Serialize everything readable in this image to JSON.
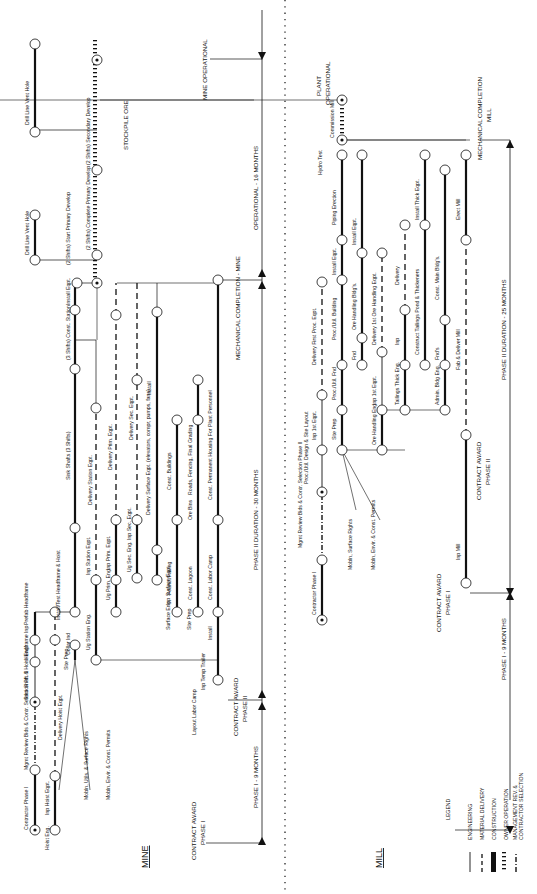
{
  "figure": {
    "orientation": "rotated-90-ccw",
    "sections": {
      "mine": "MINE",
      "mill": "MILL"
    }
  },
  "legend": {
    "title": "LEGEND",
    "items": [
      {
        "style": "thin-solid",
        "label": "ENGINEERING"
      },
      {
        "style": "dashed",
        "label": "MATERIAL DELIVERY"
      },
      {
        "style": "thick-solid",
        "label": "CONSTRUCTION"
      },
      {
        "style": "hatched",
        "label": "OWNER OPERATION"
      },
      {
        "style": "dash-dot",
        "label": "MANAGEMENT REV. &"
      },
      {
        "style": "dash-dot-cont",
        "label": "CONTRACTOR SELECTION"
      }
    ]
  },
  "mine": {
    "milestones": {
      "contract_award_1": "CONTRACT AWARD",
      "contract_award_1b": "PHASE I",
      "contract_award_2": "CONTRACT AWARD",
      "contract_award_2b": "PHASE II",
      "mech_completion": "MECHANICAL COMPLETION - MINE",
      "operational": "MINE OPERATIONAL",
      "stockpile": "STOCKPILE ORE"
    },
    "durations": {
      "phase1": "PHASE I - 9 MONTHS",
      "phase2": "PHASE II DURATION - 30 MONTHS",
      "operational": "OPERATIONAL - 16 MONTHS"
    },
    "activities": [
      {
        "label": "Contractor Phase I",
        "dur": "4"
      },
      {
        "label": "Mgmt Review Bids & Contr. Selection Ph. II",
        "dur": "5"
      },
      {
        "label": "Stkn Shaft & Hoist Eng.",
        "dur": "3"
      },
      {
        "label": "Headframe Inp",
        "dur": "2"
      },
      {
        "label": "Prefab Headframe",
        "dur": "2"
      },
      {
        "label": "Install/Test Headframe & Hoist",
        "dur": "2"
      },
      {
        "label": "Hoist Eng.",
        "dur": "1"
      },
      {
        "label": "Inp Hoist Eqpt.",
        "dur": "3"
      },
      {
        "label": "Delivery Hoist Eqpt.",
        "dur": "12"
      },
      {
        "label": "Site Prep",
        "dur": "1"
      },
      {
        "label": "Collar Ind",
        "dur": "3"
      },
      {
        "label": "Ug Station Eng.",
        "dur": "4"
      },
      {
        "label": "Inp Station Eqpt.",
        "dur": "4"
      },
      {
        "label": "Delivery Station Eqpt.",
        "dur": "12"
      },
      {
        "label": "Ug Prim. Eng.",
        "dur": "3"
      },
      {
        "label": "Inp Prim. Eqpt.",
        "dur": "4"
      },
      {
        "label": "Delivery Prim. Eqpt.",
        "dur": "12"
      },
      {
        "label": "Ug Sec. Eng.",
        "dur": "3"
      },
      {
        "label": "Inp Sec. Eqpt.",
        "dur": "4"
      },
      {
        "label": "Delivery Sec. Eqpt.",
        "dur": "14"
      },
      {
        "label": "Sink Shafts (3 Shifts)",
        "dur": "15"
      },
      {
        "label": "(3 Shifts) Const. Station",
        "dur": "4"
      },
      {
        "label": "Install Eqpt.",
        "dur": "3"
      },
      {
        "label": "(2 Shifts) Start Primary Develop",
        "dur": "2"
      },
      {
        "label": "(2 Shifts) Complete Primary Develop",
        "dur": "6"
      },
      {
        "label": "(2 Shifts) Secondary Develop",
        "dur": "5"
      },
      {
        "label": "Drill Line Vent Hole",
        "dur": "6"
      },
      {
        "label": "Drill Line Vent Hole",
        "dur": "6"
      },
      {
        "label": "Surface Eng.",
        "dur": "1"
      },
      {
        "label": "Inp Surface Eqpt.",
        "dur": "4"
      },
      {
        "label": "Delivery Surface Eqpt. (elevators, compr, pumps, fans)",
        "dur": "11"
      },
      {
        "label": "Install",
        "dur": "8"
      },
      {
        "label": "Site Prep",
        "dur": "2"
      },
      {
        "label": "Found./Paving",
        "dur": "6"
      },
      {
        "label": "Const. Buildings",
        "dur": "9"
      },
      {
        "label": "Const. Lagoon",
        "dur": "6"
      },
      {
        "label": "Ore Bins",
        "dur": "3"
      },
      {
        "label": "Roads, Fencing, Final Grading",
        "dur": "7"
      },
      {
        "label": "Layout Labor Camp",
        "dur": "1"
      },
      {
        "label": "Inp Temp Trailer",
        "dur": "2"
      },
      {
        "label": "Install",
        "dur": "2"
      },
      {
        "label": "Const. Labor Camp",
        "dur": "6"
      },
      {
        "label": "Const. Permanent Housing For Plant Personnel",
        "dur": "19"
      }
    ],
    "notes": [
      "Mobln, Utils. & Surface Rights",
      "Mobln, Envir. & Const. Permits"
    ],
    "floats": [
      "F2",
      "F3",
      "F5",
      "F5",
      "F8"
    ]
  },
  "mill": {
    "milestones": {
      "contract_award_1": "CONTRACT AWARD",
      "contract_award_1b": "PHASE I",
      "contract_award_2": "CONTRACT AWARD",
      "contract_award_2b": "PHASE II",
      "mech_completion": "MECHANICAL COMPLETION",
      "mech_completion_b": "MILL",
      "operational": "PLANT",
      "operational_b": "OPERATIONAL"
    },
    "durations": {
      "phase1": "PHASE I - 9 MONTHS",
      "phase2": "PHASE II DURATION - 25 MONTHS"
    },
    "activities": [
      {
        "label": "Contractor Phase I",
        "dur": "4"
      },
      {
        "label": "Mgmt Review Bids & Contr. Selection Phase II",
        "dur": "5"
      },
      {
        "label": "Proc./Util. Design & Site Layout",
        "dur": "3"
      },
      {
        "label": "Site Prep",
        "dur": "3"
      },
      {
        "label": "Inp 1st Eqpt.",
        "dur": "4"
      },
      {
        "label": "Proc./Util. Fnd",
        "dur": "3"
      },
      {
        "label": "Delivery First Proc. Eqpt.",
        "dur": "8"
      },
      {
        "label": "Proc./Util. Building",
        "dur": "6"
      },
      {
        "label": "Install Eqpt.",
        "dur": "3"
      },
      {
        "label": "Piping Erection",
        "dur": "6"
      },
      {
        "label": "Hydro Test",
        "dur": "1"
      },
      {
        "label": "Commission Mill",
        "dur": "3"
      },
      {
        "label": "Fnd",
        "dur": "2"
      },
      {
        "label": "Ore Handling Bldg's.",
        "dur": "6"
      },
      {
        "label": "Install Eqpt.",
        "dur": "7"
      },
      {
        "label": "Ore Handling Eng.",
        "dur": "3"
      },
      {
        "label": "Inp 1st Eqpt.",
        "dur": "4"
      },
      {
        "label": "Delivery 1st Ore Handling Eqpt.",
        "dur": "7"
      },
      {
        "label": "Tailings Thick Eng.",
        "dur": "3"
      },
      {
        "label": "Inp",
        "dur": "4"
      },
      {
        "label": "Delivery",
        "dur": "6"
      },
      {
        "label": "Construct Tailings Pond & Thickeners",
        "dur": "10"
      },
      {
        "label": "Install Thick Eqpt.",
        "dur": "5"
      },
      {
        "label": "Admin. Bldg Eng.",
        "dur": "3"
      },
      {
        "label": "Fnd's",
        "dur": "3"
      },
      {
        "label": "Const. Main Bldg's.",
        "dur": "11"
      },
      {
        "label": "Inp Mill",
        "dur": "4"
      },
      {
        "label": "Fab & Deliver Mill",
        "dur": "14"
      },
      {
        "label": "Erect Mill",
        "dur": "6"
      }
    ],
    "notes": [
      "Mobln, Surface Rights",
      "Mobln, Envir. & Const. Permits"
    ],
    "floats": [
      "F1",
      "F1",
      "F2"
    ]
  }
}
